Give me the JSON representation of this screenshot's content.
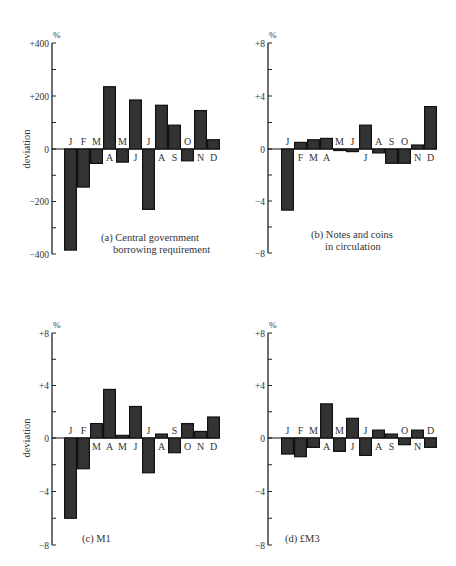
{
  "colors": {
    "bar_fill": "#333333",
    "bar_stroke": "#111111",
    "axis": "#222222",
    "text": "#333333"
  },
  "chart_data": [
    {
      "id": "a",
      "type": "bar",
      "title": "(a) Central government borrowing requirement",
      "caption_lines": [
        "(a)  Central government",
        "borrowing requirement"
      ],
      "ylabel": "deviation",
      "unit": "%",
      "categories": [
        "J",
        "F",
        "M",
        "A",
        "M",
        "J",
        "J",
        "A",
        "S",
        "O",
        "N",
        "D"
      ],
      "values": [
        -385,
        -145,
        -55,
        235,
        -50,
        185,
        -230,
        165,
        90,
        -45,
        145,
        35
      ],
      "ylim": [
        -400,
        400
      ],
      "yticks": [
        -400,
        -300,
        -200,
        -100,
        0,
        100,
        200,
        300,
        400
      ],
      "ytick_labels": [
        "−400",
        "",
        "−200",
        "",
        "0",
        "",
        "+200",
        "",
        "+400"
      ],
      "layout": {
        "axis_x": 52,
        "y_top": 43,
        "y_zero": 149,
        "y_bottom": 254,
        "bar_x0": 64,
        "bar_w": 13,
        "caption_x": 101,
        "caption_y": 241,
        "caption_indent": 12,
        "ylabel_x": 30
      }
    },
    {
      "id": "b",
      "type": "bar",
      "title": "(b) Notes and coins in circulation",
      "caption_lines": [
        "(b)  Notes and coins",
        "in circulation"
      ],
      "ylabel": "",
      "unit": "%",
      "categories": [
        "J",
        "F",
        "M",
        "A",
        "M",
        "J",
        "J",
        "A",
        "S",
        "O",
        "N",
        "D"
      ],
      "values": [
        -4.7,
        0.5,
        0.7,
        0.8,
        -0.1,
        -0.2,
        1.8,
        -0.3,
        -1.1,
        -1.1,
        0.3,
        3.2
      ],
      "ylim": [
        -8,
        8
      ],
      "yticks": [
        -8,
        -6,
        -4,
        -2,
        0,
        2,
        4,
        6,
        8
      ],
      "ytick_labels": [
        "−8",
        "",
        "−4",
        "",
        "0",
        "",
        "+4",
        "",
        "+8"
      ],
      "layout": {
        "axis_x": 268,
        "y_top": 43,
        "y_zero": 149,
        "y_bottom": 253,
        "bar_x0": 281,
        "bar_w": 13,
        "caption_x": 311,
        "caption_y": 238,
        "caption_indent": 14,
        "ylabel_x": 0
      }
    },
    {
      "id": "c",
      "type": "bar",
      "title": "(c) M1",
      "caption_lines": [
        "(c)  M1"
      ],
      "ylabel": "deviation",
      "unit": "%",
      "categories": [
        "J",
        "F",
        "M",
        "A",
        "M",
        "J",
        "J",
        "A",
        "S",
        "O",
        "N",
        "D"
      ],
      "values": [
        -6.0,
        -2.3,
        1.1,
        3.7,
        0.2,
        2.4,
        -2.6,
        0.3,
        -1.1,
        1.1,
        0.5,
        1.6
      ],
      "ylim": [
        -8,
        8
      ],
      "yticks": [
        -8,
        -6,
        -4,
        -2,
        0,
        2,
        4,
        6,
        8
      ],
      "ytick_labels": [
        "−8",
        "",
        "−4",
        "",
        "0",
        "",
        "+4",
        "",
        "+8"
      ],
      "layout": {
        "axis_x": 52,
        "y_top": 333,
        "y_zero": 438,
        "y_bottom": 545,
        "bar_x0": 64,
        "bar_w": 13,
        "caption_x": 82,
        "caption_y": 542,
        "caption_indent": 0,
        "ylabel_x": 30
      }
    },
    {
      "id": "d",
      "type": "bar",
      "title": "(d) £M3",
      "caption_lines": [
        "(d)  £M3"
      ],
      "ylabel": "",
      "unit": "%",
      "categories": [
        "J",
        "F",
        "M",
        "A",
        "M",
        "J",
        "J",
        "A",
        "S",
        "O",
        "N",
        "D"
      ],
      "values": [
        -1.2,
        -1.4,
        -0.7,
        2.6,
        -1.0,
        1.5,
        -1.3,
        0.6,
        0.3,
        -0.5,
        0.6,
        -0.7
      ],
      "ylim": [
        -8,
        8
      ],
      "yticks": [
        -8,
        -6,
        -4,
        -2,
        0,
        2,
        4,
        6,
        8
      ],
      "ytick_labels": [
        "−8",
        "",
        "−4",
        "",
        "0",
        "",
        "+4",
        "",
        "+8"
      ],
      "layout": {
        "axis_x": 268,
        "y_top": 333,
        "y_zero": 438,
        "y_bottom": 545,
        "bar_x0": 281,
        "bar_w": 13,
        "caption_x": 285,
        "caption_y": 542,
        "caption_indent": 0,
        "ylabel_x": 0
      }
    }
  ]
}
